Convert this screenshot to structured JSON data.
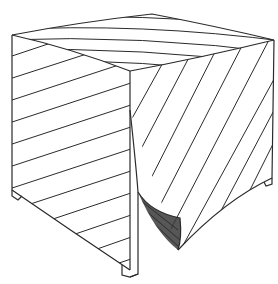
{
  "image": {
    "description": "Pencil line drawing of a cube-shaped box draped with a diagonally striped cloth; the front corner of the cloth is split and curls back revealing a shaded inner fold.",
    "colors": {
      "background": "#ffffff",
      "line": "#2a2a2a",
      "shade": "#3a3a3a"
    }
  }
}
